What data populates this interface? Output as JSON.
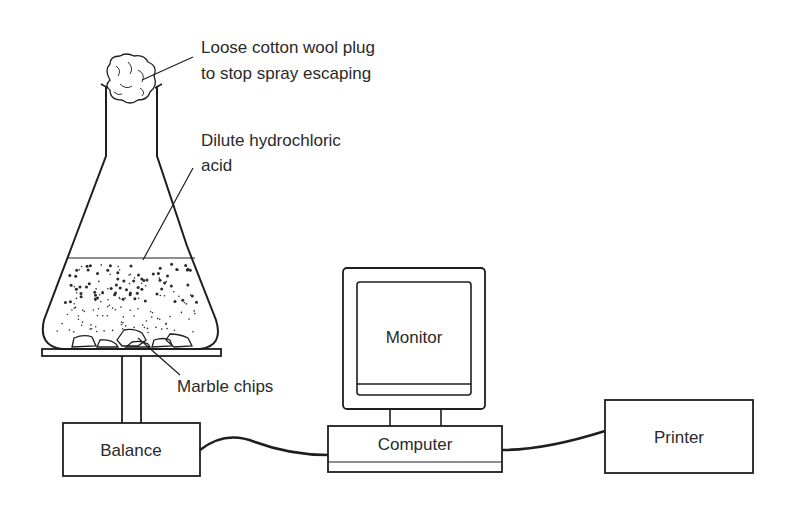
{
  "labels": {
    "cotton_plug_line1": "Loose cotton wool plug",
    "cotton_plug_line2": "to stop spray escaping",
    "acid_line1": "Dilute hydrochloric",
    "acid_line2": "acid",
    "marble": "Marble chips",
    "monitor": "Monitor",
    "balance": "Balance",
    "computer": "Computer",
    "printer": "Printer"
  },
  "components": [
    "Conical flask",
    "Cotton wool plug",
    "Dilute hydrochloric acid",
    "Marble chips",
    "Balance",
    "Computer",
    "Monitor",
    "Printer"
  ],
  "connections": [
    {
      "from": "Balance",
      "to": "Computer"
    },
    {
      "from": "Computer",
      "to": "Printer"
    },
    {
      "from": "Computer",
      "to": "Monitor"
    }
  ],
  "colors": {
    "ink": "#1e1e1e",
    "text": "#2a2a2a",
    "background": "#ffffff"
  }
}
